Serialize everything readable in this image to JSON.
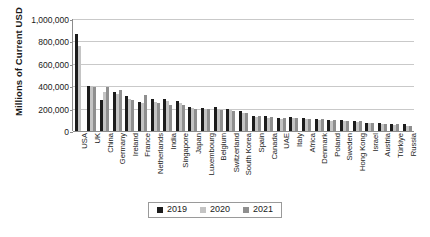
{
  "chart_data": {
    "type": "bar",
    "title": "",
    "subtitle": "",
    "xlabel": "",
    "ylabel": "Millions of Current USD",
    "ylim": [
      0,
      1000000
    ],
    "ytick_labels": [
      "0",
      "200,000",
      "400,000",
      "600,000",
      "800,000",
      "1,000,000"
    ],
    "ytick_values": [
      0,
      200000,
      400000,
      600000,
      800000,
      1000000
    ],
    "grid": "horizontal",
    "legend_position": "bottom",
    "categories": [
      "USA",
      "UK",
      "China",
      "Germany",
      "Ireland",
      "France",
      "Netherlands",
      "India",
      "Singapore",
      "Japan",
      "Luxembourg",
      "Belgium",
      "Switzerland",
      "South Korea",
      "Spain",
      "Canada",
      "UAE",
      "Italy",
      "Africa",
      "Denmark",
      "Poland",
      "Sweden",
      "Hong Kong",
      "Israel",
      "Austria",
      "Türkiye",
      "Russia"
    ],
    "series": [
      {
        "name": "2019",
        "color": "#1c1c1c",
        "values": [
          865000,
          405000,
          280000,
          345000,
          315000,
          255000,
          290000,
          290000,
          265000,
          215000,
          205000,
          210000,
          200000,
          175000,
          135000,
          130000,
          120000,
          125000,
          120000,
          110000,
          95000,
          95000,
          90000,
          75000,
          70000,
          65000,
          60000
        ]
      },
      {
        "name": "2020",
        "color": "#c4c4c4",
        "values": [
          760000,
          400000,
          350000,
          330000,
          290000,
          250000,
          255000,
          265000,
          250000,
          205000,
          195000,
          200000,
          190000,
          165000,
          125000,
          120000,
          110000,
          115000,
          110000,
          100000,
          85000,
          85000,
          80000,
          68000,
          62000,
          55000,
          48000
        ]
      },
      {
        "name": "2021",
        "color": "#8f8f8f",
        "values": [
          0,
          395000,
          390000,
          370000,
          275000,
          320000,
          250000,
          230000,
          230000,
          200000,
          200000,
          185000,
          180000,
          160000,
          135000,
          125000,
          120000,
          115000,
          110000,
          105000,
          100000,
          90000,
          85000,
          72000,
          65000,
          60000,
          45000
        ]
      }
    ]
  },
  "legend": {
    "entries": [
      {
        "label": "2019",
        "color": "#1c1c1c"
      },
      {
        "label": "2020",
        "color": "#c4c4c4"
      },
      {
        "label": "2021",
        "color": "#8f8f8f"
      }
    ]
  }
}
